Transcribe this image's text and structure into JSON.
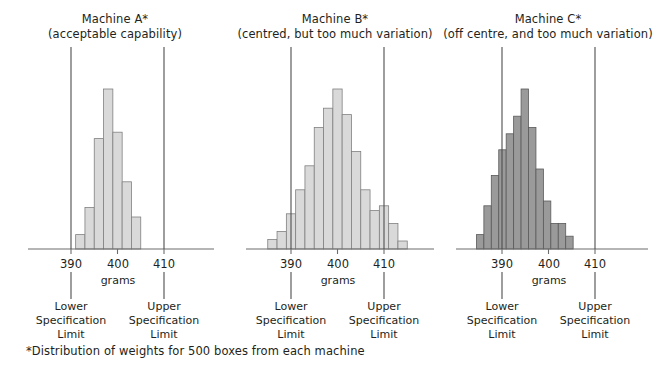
{
  "footnote": "*Distribution of weights for 500 boxes from each machine",
  "common": {
    "axis_name": "grams",
    "tick_labels": [
      "390",
      "400",
      "410"
    ],
    "lower_limit_caption": "Lower\nSpecification\nLimit",
    "lower_limit_line1": "Lower",
    "lower_limit_line2": "Specification",
    "lower_limit_line3": "Limit",
    "upper_limit_line1": "Upper",
    "upper_limit_line2": "Specification",
    "upper_limit_line3": "Limit",
    "lower_spec_value": 390,
    "upper_spec_value": 410
  },
  "colors": {
    "background": "#ffffff",
    "text": "#231f20",
    "axis": "#6d6d6d",
    "spec_line": "#4d4d4d",
    "bar_light_fill": "#d9d9d9",
    "bar_light_stroke": "#808080",
    "bar_dark_fill": "#9a9a9a",
    "bar_dark_stroke": "#5a5a5a"
  },
  "chart_data": [
    {
      "type": "bar",
      "id": "machine-a",
      "title": "Machine A*",
      "subtitle": "(acceptable capability)",
      "xlabel": "grams",
      "ylabel": "",
      "xlim": [
        384,
        418
      ],
      "ylim": [
        0,
        100
      ],
      "grid": false,
      "bin_width": 2,
      "bar_fill": "#d9d9d9",
      "bar_stroke": "#808080",
      "lower_spec": 390,
      "upper_spec": 410,
      "bin_starts": [
        391,
        393,
        395,
        397,
        399,
        401,
        403
      ],
      "values": [
        9,
        26,
        69,
        100,
        73,
        42,
        20
      ],
      "annotations": [
        "Lower Specification Limit",
        "Upper Specification Limit"
      ]
    },
    {
      "type": "bar",
      "id": "machine-b",
      "title": "Machine B*",
      "subtitle": "(centred, but too much variation)",
      "xlabel": "grams",
      "ylabel": "",
      "xlim": [
        384,
        418
      ],
      "ylim": [
        0,
        100
      ],
      "grid": false,
      "bin_width": 2,
      "bar_fill": "#d9d9d9",
      "bar_stroke": "#808080",
      "lower_spec": 390,
      "upper_spec": 410,
      "bin_starts": [
        385,
        387,
        389,
        391,
        393,
        395,
        397,
        399,
        401,
        403,
        405,
        407,
        409,
        411,
        413
      ],
      "values": [
        6,
        11,
        22,
        37,
        52,
        76,
        88,
        100,
        84,
        61,
        37,
        24,
        27,
        16,
        5
      ],
      "annotations": [
        "Lower Specification Limit",
        "Upper Specification Limit"
      ]
    },
    {
      "type": "bar",
      "id": "machine-c",
      "title": "Machine C*",
      "subtitle": "(off centre, and too much variation)",
      "xlabel": "grams",
      "ylabel": "",
      "xlim": [
        384,
        418
      ],
      "ylim": [
        0,
        100
      ],
      "grid": false,
      "bin_width": 1.6,
      "bar_fill": "#9a9a9a",
      "bar_stroke": "#5a5a5a",
      "lower_spec": 390,
      "upper_spec": 410,
      "bin_starts": [
        384.5,
        386.1,
        387.7,
        389.3,
        390.9,
        392.5,
        394.1,
        395.7,
        397.3,
        398.9,
        400.5,
        402.1,
        403.7
      ],
      "values": [
        9,
        27,
        46,
        62,
        72,
        83,
        100,
        76,
        50,
        30,
        16,
        16,
        8
      ],
      "annotations": [
        "Lower Specification Limit",
        "Upper Specification Limit"
      ]
    }
  ]
}
